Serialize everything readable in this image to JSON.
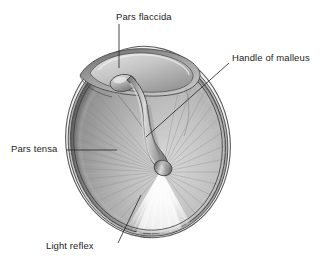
{
  "figure": {
    "background_color": "#ffffff",
    "width": 324,
    "height": 263
  },
  "labels": [
    {
      "id": "pars-flaccida",
      "text": "Pars flaccida",
      "leader": {
        "type": "straight",
        "x1": 119,
        "y1": 24,
        "x2": 119,
        "y2": 68
      }
    },
    {
      "id": "handle-of-malleus",
      "text": "Handle of malleus",
      "leader": {
        "type": "straight",
        "x1": 229,
        "y1": 63,
        "x2": 146,
        "y2": 137
      }
    },
    {
      "id": "pars-tensa",
      "text": "Pars tensa",
      "leader": {
        "type": "straight",
        "x1": 66,
        "y1": 150,
        "x2": 117,
        "y2": 150
      }
    },
    {
      "id": "light-reflex",
      "text": "Light reflex",
      "leader": {
        "type": "straight",
        "x1": 118,
        "y1": 243,
        "x2": 141,
        "y2": 195
      }
    }
  ],
  "anatomy": {
    "membrane_fill": "#b4b4b4",
    "membrane_light": "#d8d8d8",
    "membrane_dark": "#8f8f8f",
    "rim_color": "#4a4a4a",
    "annulus_color": "#c8c8c8",
    "malleus_color": "#a6a6a6",
    "malleus_shadow": "#767676",
    "malleus_highlight": "#dcdcdc",
    "pars_flaccida_fill": "#bdbdbd",
    "light_reflex_color": "#f4f4f4",
    "striation_color": "#9b9b9b",
    "label_text_color": "#1d1d1d",
    "leader_line_color": "#2a2a2a",
    "parts": [
      {
        "name": "pars-flaccida",
        "region": "superior"
      },
      {
        "name": "pars-tensa",
        "region": "main-membrane"
      },
      {
        "name": "handle-of-malleus",
        "region": "central-stria"
      },
      {
        "name": "light-reflex",
        "region": "antero-inferior"
      },
      {
        "name": "umbo",
        "region": "center"
      },
      {
        "name": "annulus",
        "region": "perimeter"
      },
      {
        "name": "short-process-of-malleus",
        "region": "superior"
      }
    ]
  }
}
